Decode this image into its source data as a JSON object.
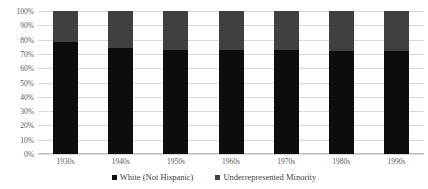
{
  "chart_data": {
    "type": "bar",
    "subtype": "stacked-100-percent",
    "title": "",
    "xlabel": "",
    "ylabel": "",
    "categories": [
      "1930s",
      "1940s",
      "1950s",
      "1960s",
      "1970s",
      "1980s",
      "1990s"
    ],
    "series": [
      {
        "name": "White (Not Hispanic)",
        "color": "#0d0d0d",
        "values": [
          78,
          74,
          73,
          73,
          73,
          72,
          72
        ]
      },
      {
        "name": "Underrepresented Minority",
        "color": "#404040",
        "values": [
          22,
          26,
          27,
          27,
          27,
          28,
          28
        ]
      }
    ],
    "ylim": [
      0,
      100
    ],
    "ytick_labels": [
      "100%",
      "90%",
      "80%",
      "70%",
      "60%",
      "50%",
      "40%",
      "30%",
      "20%",
      "10%",
      "0%"
    ],
    "ytick_values": [
      100,
      90,
      80,
      70,
      60,
      50,
      40,
      30,
      20,
      10,
      0
    ],
    "grid": true,
    "legend_position": "bottom"
  },
  "legend": {
    "items": [
      {
        "label": "White (Not Hispanic)",
        "color": "#0d0d0d",
        "marker": "square-marker-icon"
      },
      {
        "label": "Underrepresented Minority",
        "color": "#404040",
        "marker": "square-marker-icon"
      }
    ]
  }
}
